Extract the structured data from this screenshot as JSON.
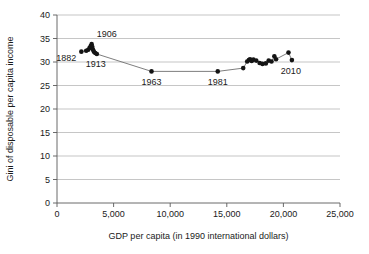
{
  "chart_data": {
    "type": "scatter",
    "title": "",
    "subtitle": "",
    "xlabel": "GDP per capita (in 1990 international dollars)",
    "ylabel": "Gini of disposable per capita income",
    "xlim": [
      0,
      25000
    ],
    "ylim": [
      0,
      40
    ],
    "xticks": [
      0,
      5000,
      10000,
      15000,
      20000,
      25000
    ],
    "xticklabels": [
      "0",
      "5,000",
      "10,000",
      "15,000",
      "20,000",
      "25,000"
    ],
    "yticks": [
      0,
      5,
      10,
      15,
      20,
      25,
      30,
      35,
      40
    ],
    "yticklabels": [
      "0",
      "5",
      "10",
      "15",
      "20",
      "25",
      "30",
      "35",
      "40"
    ],
    "grid": "horizontal",
    "legend": "none",
    "series": [
      {
        "name": "Gini vs GDP per capita",
        "connected": true,
        "marker": "filled-circle",
        "marker_color": "#141414",
        "line_color": "#6f6f6f",
        "points": [
          {
            "x": 2150,
            "y": 32.2,
            "label": "1882"
          },
          {
            "x": 2580,
            "y": 32.4,
            "label": ""
          },
          {
            "x": 2760,
            "y": 32.6,
            "label": ""
          },
          {
            "x": 2880,
            "y": 33.0,
            "label": ""
          },
          {
            "x": 2980,
            "y": 33.4,
            "label": ""
          },
          {
            "x": 3060,
            "y": 33.8,
            "label": "1906"
          },
          {
            "x": 3120,
            "y": 33.2,
            "label": ""
          },
          {
            "x": 3180,
            "y": 32.6,
            "label": ""
          },
          {
            "x": 3260,
            "y": 32.2,
            "label": ""
          },
          {
            "x": 3380,
            "y": 31.9,
            "label": ""
          },
          {
            "x": 3520,
            "y": 31.7,
            "label": "1913"
          },
          {
            "x": 8350,
            "y": 28.0,
            "label": "1963"
          },
          {
            "x": 14200,
            "y": 28.0,
            "label": "1981"
          },
          {
            "x": 16450,
            "y": 28.7,
            "label": ""
          },
          {
            "x": 16800,
            "y": 30.1,
            "label": ""
          },
          {
            "x": 16950,
            "y": 30.4,
            "label": ""
          },
          {
            "x": 17050,
            "y": 30.6,
            "label": ""
          },
          {
            "x": 17200,
            "y": 30.2,
            "label": ""
          },
          {
            "x": 17350,
            "y": 30.5,
            "label": ""
          },
          {
            "x": 17600,
            "y": 30.3,
            "label": ""
          },
          {
            "x": 17900,
            "y": 29.8,
            "label": ""
          },
          {
            "x": 18150,
            "y": 29.6,
            "label": ""
          },
          {
            "x": 18450,
            "y": 29.7,
            "label": ""
          },
          {
            "x": 18700,
            "y": 30.3,
            "label": ""
          },
          {
            "x": 18950,
            "y": 30.1,
            "label": ""
          },
          {
            "x": 19200,
            "y": 31.2,
            "label": ""
          },
          {
            "x": 19350,
            "y": 30.6,
            "label": ""
          },
          {
            "x": 20450,
            "y": 32.0,
            "label": ""
          },
          {
            "x": 20750,
            "y": 30.4,
            "label": "2010"
          }
        ]
      }
    ],
    "annotations": [
      {
        "text": "1882",
        "x": 2150,
        "y": 32.2,
        "anchor": "right-below"
      },
      {
        "text": "1906",
        "x": 3060,
        "y": 33.8,
        "anchor": "above-right"
      },
      {
        "text": "1913",
        "x": 3520,
        "y": 31.7,
        "anchor": "below"
      },
      {
        "text": "1963",
        "x": 8350,
        "y": 28.0,
        "anchor": "below"
      },
      {
        "text": "1981",
        "x": 14200,
        "y": 28.0,
        "anchor": "below"
      },
      {
        "text": "2010",
        "x": 20750,
        "y": 30.4,
        "anchor": "below-left"
      }
    ]
  },
  "colors": {
    "marker": "#141414",
    "line": "#6f6f6f",
    "grid": "#aeaeae",
    "axis": "#5a5a5a",
    "text": "#1a1a1a",
    "background": "#ffffff"
  }
}
